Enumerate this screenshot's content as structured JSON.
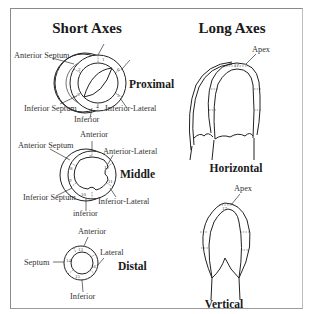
{
  "figure": {
    "left_title": "Short Axes",
    "right_title": "Long Axes"
  },
  "short_axes": {
    "proximal": {
      "section_label": "Proximal",
      "labels": {
        "anterior_septum": "Anterior Septum",
        "inferior_septum": "Inferior Septum",
        "inferior": "Inferior",
        "inferior_lateral": "Inferior-Lateral"
      },
      "segments": [
        "1",
        "2",
        "3",
        "4",
        "5",
        "6"
      ]
    },
    "middle": {
      "section_label": "Middle",
      "labels": {
        "anterior": "Anterior",
        "anterior_septum": "Anterior Septum",
        "anterior_lateral": "Anterior-Lateral",
        "inferior_septum": "Inferior Septum",
        "inferior_lateral": "Inferior-Lateral",
        "inferior": "inferior"
      },
      "segments": [
        "7",
        "8",
        "9",
        "10",
        "11",
        "12"
      ]
    },
    "distal": {
      "section_label": "Distal",
      "labels": {
        "anterior": "Anterior",
        "lateral": "Lateral",
        "septum": "Septum",
        "inferior": "Inferior"
      },
      "segments": [
        "13",
        "14",
        "15",
        "16"
      ]
    }
  },
  "long_axes": {
    "horizontal": {
      "section_label": "Horizontal",
      "apex_label": "Apex",
      "apex_segment": "17"
    },
    "vertical": {
      "section_label": "Vertical",
      "apex_label": "Apex",
      "apex_segment": "17"
    }
  }
}
